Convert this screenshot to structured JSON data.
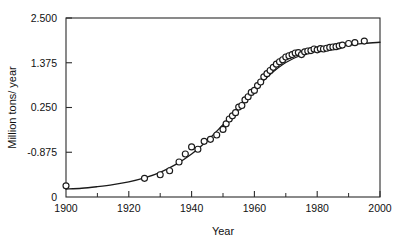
{
  "chart_data": {
    "type": "scatter",
    "title": "",
    "subtitle": "",
    "xlabel": "Year",
    "ylabel": "Million tons/ year",
    "xlim": [
      1900,
      2000
    ],
    "ylim": [
      -2.0,
      2.5
    ],
    "grid": false,
    "legend": null,
    "x_ticks": [
      1900,
      1920,
      1940,
      1960,
      1980,
      2000
    ],
    "x_tick_labels": [
      "1900",
      "1920",
      "1940",
      "1960",
      "1980",
      "2000"
    ],
    "x_minor_ticks": [
      1910,
      1930,
      1950,
      1970,
      1990
    ],
    "y_ticks": [
      -2.0,
      -0.875,
      0.25,
      1.375,
      2.5
    ],
    "y_tick_labels": [
      "0",
      "-0.875",
      "0.250",
      "1.375",
      "2.500"
    ],
    "series": [
      {
        "name": "observations",
        "marker": "open-circle",
        "x": [
          1900,
          1925,
          1930,
          1933,
          1936,
          1938,
          1940,
          1942,
          1944,
          1946,
          1948,
          1950,
          1951,
          1952,
          1953,
          1954,
          1955,
          1956,
          1957,
          1958,
          1959,
          1960,
          1961,
          1962,
          1963,
          1964,
          1965,
          1966,
          1967,
          1968,
          1969,
          1970,
          1971,
          1972,
          1973,
          1974,
          1975,
          1976,
          1977,
          1978,
          1979,
          1980,
          1981,
          1982,
          1983,
          1984,
          1985,
          1986,
          1987,
          1988,
          1990,
          1992,
          1995
        ],
        "y": [
          -1.72,
          -1.53,
          -1.44,
          -1.34,
          -1.12,
          -0.92,
          -0.74,
          -0.8,
          -0.6,
          -0.55,
          -0.44,
          -0.3,
          -0.16,
          -0.04,
          0.04,
          0.12,
          0.26,
          0.3,
          0.44,
          0.52,
          0.63,
          0.68,
          0.8,
          0.89,
          1.02,
          1.1,
          1.18,
          1.26,
          1.34,
          1.4,
          1.45,
          1.52,
          1.55,
          1.58,
          1.62,
          1.63,
          1.58,
          1.65,
          1.67,
          1.68,
          1.72,
          1.7,
          1.73,
          1.72,
          1.74,
          1.76,
          1.77,
          1.78,
          1.8,
          1.82,
          1.86,
          1.88,
          1.92
        ]
      },
      {
        "name": "logistic-fit",
        "marker": "none",
        "line": "solid",
        "x": [
          1900,
          1905,
          1910,
          1915,
          1920,
          1925,
          1930,
          1935,
          1940,
          1945,
          1950,
          1955,
          1960,
          1965,
          1970,
          1975,
          1980,
          1985,
          1990,
          1995,
          2000
        ],
        "y": [
          -1.8,
          -1.78,
          -1.74,
          -1.69,
          -1.62,
          -1.52,
          -1.38,
          -1.18,
          -0.92,
          -0.58,
          -0.18,
          0.26,
          0.7,
          1.08,
          1.38,
          1.57,
          1.69,
          1.77,
          1.82,
          1.86,
          1.89
        ]
      }
    ]
  }
}
